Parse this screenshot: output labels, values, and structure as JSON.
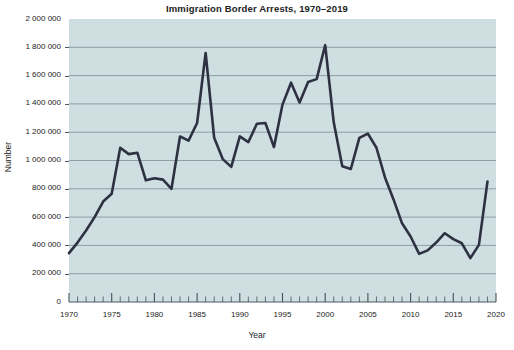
{
  "chart_data": {
    "type": "line",
    "title": "Immigration Border Arrests, 1970–2019",
    "xlabel": "Year",
    "ylabel": "Number",
    "xlim": [
      1970,
      2020
    ],
    "ylim": [
      0,
      2000000
    ],
    "grid": true,
    "legend": null,
    "plot_background_color": "#cfdee0",
    "line_color": "#2d3142",
    "x_tick_labels": [
      "1970",
      "1975",
      "1980",
      "1985",
      "1990",
      "1995",
      "2000",
      "2005",
      "2010",
      "2015",
      "2020"
    ],
    "x_tick_values": [
      1970,
      1975,
      1980,
      1985,
      1990,
      1995,
      2000,
      2005,
      2010,
      2015,
      2020
    ],
    "x_minor_tick_interval": 1,
    "y_tick_labels": [
      "0",
      "200 000",
      "400 000",
      "600 000",
      "800 000",
      "1 000 000",
      "1 200 000",
      "1 400 000",
      "1 600 000",
      "1 800 000",
      "2 000 000"
    ],
    "y_tick_values": [
      0,
      200000,
      400000,
      600000,
      800000,
      1000000,
      1200000,
      1400000,
      1600000,
      1800000,
      2000000
    ],
    "x": [
      1970,
      1971,
      1972,
      1973,
      1974,
      1975,
      1976,
      1977,
      1978,
      1979,
      1980,
      1981,
      1982,
      1983,
      1984,
      1985,
      1986,
      1987,
      1988,
      1989,
      1990,
      1991,
      1992,
      1993,
      1994,
      1995,
      1996,
      1997,
      1998,
      1999,
      2000,
      2001,
      2002,
      2003,
      2004,
      2005,
      2006,
      2007,
      2008,
      2009,
      2010,
      2011,
      2012,
      2013,
      2014,
      2015,
      2016,
      2017,
      2018,
      2019
    ],
    "values": [
      345000,
      420000,
      505000,
      600000,
      710000,
      765000,
      1090000,
      1045000,
      1055000,
      860000,
      875000,
      865000,
      800000,
      1170000,
      1140000,
      1265000,
      1760000,
      1160000,
      1010000,
      955000,
      1170000,
      1130000,
      1260000,
      1265000,
      1095000,
      1395000,
      1550000,
      1410000,
      1555000,
      1575000,
      1815000,
      1270000,
      960000,
      940000,
      1160000,
      1190000,
      1090000,
      880000,
      725000,
      556000,
      463000,
      340000,
      365000,
      420000,
      486000,
      444000,
      415000,
      310000,
      404000,
      851000
    ]
  }
}
